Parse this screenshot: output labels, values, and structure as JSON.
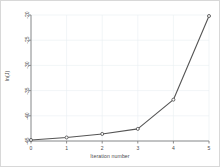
{
  "chart_data": {
    "type": "line",
    "title": "",
    "subtitle": "",
    "xlabel": "Iteration number",
    "ylabel": "ln(J)",
    "x": [
      0,
      1,
      2,
      3,
      4,
      5
    ],
    "values": [
      -44.8,
      -44.3,
      -43.6,
      -42.6,
      -36.8,
      -20.2
    ],
    "series": [
      {
        "name": "ln(J)",
        "values": [
          -44.8,
          -44.3,
          -43.6,
          -42.6,
          -36.8,
          -20.2
        ]
      }
    ],
    "xticks": [
      "0",
      "1",
      "2",
      "3",
      "4",
      "5"
    ],
    "yticks": [
      "-45",
      "-40",
      "-35",
      "-30",
      "-25",
      "-20"
    ],
    "xlim": [
      0,
      5
    ],
    "ylim": [
      -45,
      -20
    ],
    "grid": true,
    "legend": null,
    "marker": "circle",
    "line_color": "#555555",
    "marker_color": "#555555",
    "grid_color": "#e8eef2",
    "axis_color": "#808080",
    "background": "#ffffff",
    "border_color": "#d8d8d8"
  }
}
